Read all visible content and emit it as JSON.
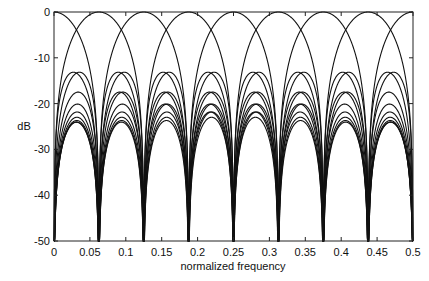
{
  "chart_data": {
    "type": "line",
    "title": "",
    "xlabel": "normalized frequency",
    "ylabel": "dB",
    "xlim": [
      0,
      0.5
    ],
    "ylim": [
      -50,
      0
    ],
    "grid": false,
    "legend": null,
    "x_ticks": [
      "0",
      "0.05",
      "0.1",
      "0.15",
      "0.2",
      "0.25",
      "0.3",
      "0.35",
      "0.4",
      "0.45",
      "0.5"
    ],
    "y_ticks": [
      "0",
      "-10",
      "-20",
      "-30",
      "-40",
      "-50"
    ],
    "series_generator": {
      "N": 16,
      "centers": [
        -0.0625,
        0,
        0.0625,
        0.125,
        0.1875,
        0.25,
        0.3125,
        0.375,
        0.4375,
        0.5,
        0.5625
      ],
      "floor_db": -50
    },
    "sidelobe_levels_db": [
      -22.5,
      -30,
      -34,
      -37,
      -39,
      -40.5,
      -42
    ]
  },
  "axes": {
    "xlabel": "normalized frequency",
    "ylabel": "dB"
  }
}
